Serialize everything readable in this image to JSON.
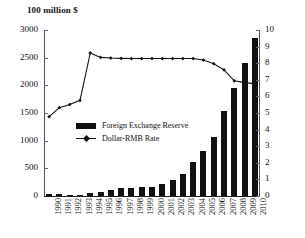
{
  "chart": {
    "axis_title": "100 million $",
    "left_axis_ticks": [
      "0",
      "500",
      "1000",
      "1500",
      "2000",
      "2500",
      "3000"
    ],
    "right_axis_ticks": [
      "0",
      "1",
      "2",
      "3",
      "4",
      "5",
      "6",
      "7",
      "8",
      "9",
      "10"
    ],
    "legend": {
      "bar_label": "Foreign Exchange Reserve",
      "line_label": "Dollar-RMB Rate"
    },
    "colors": {
      "bar": "#111111",
      "line": "#111111",
      "axis": "#555555",
      "background": "#ffffff"
    }
  },
  "chart_data": {
    "type": "bar",
    "title": "",
    "subtitle": "",
    "xlabel": "",
    "ylabel": "100 million $",
    "y2label": "",
    "ylim": [
      0,
      3000
    ],
    "y2lim": [
      0,
      10
    ],
    "grid": false,
    "legend_position": "center",
    "categories": [
      "1990",
      "1991",
      "1992",
      "1993",
      "1994",
      "1995",
      "1996",
      "1997",
      "1998",
      "1999",
      "2000",
      "2001",
      "2002",
      "2003",
      "2004",
      "2005",
      "2006",
      "2007",
      "2008",
      "2009",
      "2010"
    ],
    "series": [
      {
        "name": "Foreign Exchange Reserve",
        "type": "bar",
        "axis": "left",
        "values": [
          29,
          43,
          19,
          21,
          52,
          73,
          105,
          140,
          145,
          155,
          166,
          212,
          286,
          403,
          610,
          819,
          1066,
          1528,
          1946,
          2399,
          2847
        ]
      },
      {
        "name": "Dollar-RMB Rate",
        "type": "line",
        "axis": "right",
        "values": [
          4.78,
          5.32,
          5.51,
          5.76,
          8.62,
          8.35,
          8.31,
          8.29,
          8.28,
          8.28,
          8.28,
          8.28,
          8.28,
          8.28,
          8.28,
          8.19,
          7.97,
          7.6,
          6.94,
          6.83,
          6.77
        ]
      }
    ]
  }
}
